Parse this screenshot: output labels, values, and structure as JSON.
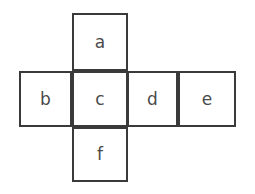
{
  "diagram": {
    "type": "cube-net",
    "title": "",
    "background_color": "#ffffff",
    "stroke_color": "#3a3a3a",
    "stroke_width": 2,
    "label_color": "#4a4a4a",
    "faces": [
      {
        "id": "a",
        "label": "a",
        "x": 72,
        "y": 13,
        "w": 56,
        "h": 58,
        "row": "top",
        "col": 2
      },
      {
        "id": "b",
        "label": "b",
        "x": 19,
        "y": 71,
        "w": 53,
        "h": 56,
        "row": "middle",
        "col": 1
      },
      {
        "id": "c",
        "label": "c",
        "x": 72,
        "y": 71,
        "w": 56,
        "h": 56,
        "row": "middle",
        "col": 2
      },
      {
        "id": "d",
        "label": "d",
        "x": 127,
        "y": 71,
        "w": 51,
        "h": 56,
        "row": "middle",
        "col": 3
      },
      {
        "id": "e",
        "label": "e",
        "x": 178,
        "y": 71,
        "w": 58,
        "h": 56,
        "row": "middle",
        "col": 4
      },
      {
        "id": "f",
        "label": "f",
        "x": 72,
        "y": 127,
        "w": 56,
        "h": 55,
        "row": "bottom",
        "col": 2
      }
    ]
  }
}
